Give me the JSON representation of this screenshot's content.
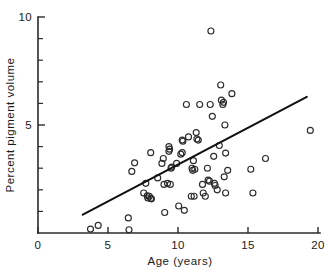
{
  "chart_data": {
    "type": "scatter",
    "title": "",
    "xlabel": "Age (years)",
    "ylabel": "Percent pigment volume",
    "xlim": [
      0,
      20
    ],
    "ylim": [
      0,
      10
    ],
    "grid": false,
    "legend": null,
    "x_ticks_major": [
      0,
      5,
      10,
      15,
      20
    ],
    "x_ticklabels": [
      "0",
      "5",
      "10",
      "15",
      "20"
    ],
    "y_ticks_major": [
      5,
      10
    ],
    "y_ticklabels": [
      "5",
      "10"
    ],
    "y_ticks_minor": [
      1,
      2,
      3,
      4,
      6,
      7,
      8,
      9
    ],
    "marker": "open-circle",
    "marker_radius_px": 3.0,
    "n_points": 73,
    "points": [
      [
        3.75,
        0.18
      ],
      [
        4.3,
        0.35
      ],
      [
        6.45,
        0.7
      ],
      [
        6.5,
        0.15
      ],
      [
        6.7,
        2.85
      ],
      [
        6.9,
        3.25
      ],
      [
        7.55,
        1.85
      ],
      [
        7.7,
        2.3
      ],
      [
        7.85,
        1.62
      ],
      [
        8.05,
        1.6
      ],
      [
        7.95,
        1.7
      ],
      [
        8.05,
        3.72
      ],
      [
        8.55,
        2.55
      ],
      [
        8.85,
        3.22
      ],
      [
        8.95,
        3.45
      ],
      [
        9.0,
        2.25
      ],
      [
        9.45,
        2.25
      ],
      [
        9.05,
        0.95
      ],
      [
        9.35,
        4.0
      ],
      [
        9.35,
        3.78
      ],
      [
        9.5,
        3.0
      ],
      [
        9.55,
        3.05
      ],
      [
        9.9,
        3.22
      ],
      [
        10.05,
        1.25
      ],
      [
        10.2,
        3.65
      ],
      [
        10.3,
        3.72
      ],
      [
        10.3,
        4.3
      ],
      [
        10.6,
        5.95
      ],
      [
        10.45,
        1.05
      ],
      [
        10.95,
        1.7
      ],
      [
        11.15,
        1.7
      ],
      [
        11.0,
        3.0
      ],
      [
        11.2,
        2.95
      ],
      [
        11.1,
        3.35
      ],
      [
        11.35,
        4.35
      ],
      [
        11.45,
        4.3
      ],
      [
        11.3,
        4.65
      ],
      [
        11.55,
        5.95
      ],
      [
        11.75,
        2.25
      ],
      [
        11.8,
        1.85
      ],
      [
        11.95,
        1.7
      ],
      [
        12.1,
        3.0
      ],
      [
        12.25,
        2.4
      ],
      [
        12.3,
        5.95
      ],
      [
        12.35,
        9.35
      ],
      [
        12.45,
        5.4
      ],
      [
        12.55,
        3.55
      ],
      [
        12.6,
        2.3
      ],
      [
        12.8,
        2.0
      ],
      [
        12.95,
        4.05
      ],
      [
        13.05,
        6.85
      ],
      [
        13.1,
        6.15
      ],
      [
        13.2,
        5.95
      ],
      [
        13.35,
        5.0
      ],
      [
        13.4,
        3.7
      ],
      [
        13.4,
        1.85
      ],
      [
        13.55,
        2.9
      ],
      [
        13.85,
        6.45
      ],
      [
        15.2,
        2.95
      ],
      [
        15.35,
        1.85
      ],
      [
        16.25,
        3.45
      ],
      [
        19.45,
        4.75
      ],
      [
        8.1,
        1.58
      ],
      [
        9.4,
        3.88
      ],
      [
        10.75,
        4.45
      ],
      [
        12.15,
        2.45
      ],
      [
        9.25,
        2.3
      ],
      [
        11.05,
        2.9
      ],
      [
        12.65,
        2.2
      ],
      [
        13.3,
        2.6
      ],
      [
        7.8,
        1.72
      ],
      [
        10.35,
        4.25
      ],
      [
        13.25,
        6.05
      ]
    ],
    "fit_line": {
      "label": "least-squares fit",
      "x_start": 3.2,
      "y_start": 0.85,
      "x_end": 19.2,
      "y_end": 6.3
    }
  }
}
